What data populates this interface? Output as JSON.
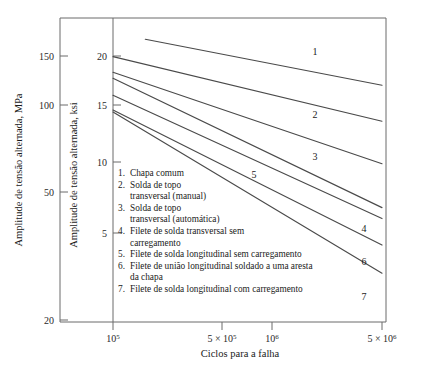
{
  "chart_data": {
    "type": "line",
    "title": "",
    "xlabel": "Ciclos para a falha",
    "ylabel_left": "Amplitude de tensão alternada, MPa",
    "ylabel_right": "Amplitude de tensão alternada, ksi",
    "xscale": "log",
    "yscale": "log",
    "xlim": [
      100000,
      5000000
    ],
    "ylim_mpa": [
      20,
      170
    ],
    "ylim_ksi": [
      2.9,
      24.7
    ],
    "xticks": [
      100000,
      500000,
      1000000,
      5000000
    ],
    "xticklabels": [
      "10⁵",
      "5 × 10⁵",
      "10⁶",
      "5 × 10⁶"
    ],
    "yticks_mpa": [
      150,
      100,
      50,
      20
    ],
    "yticklabels_mpa": [
      "150",
      "100",
      "50",
      "20"
    ],
    "yticks_ksi": [
      20,
      15,
      10,
      5
    ],
    "yticklabels_ksi": [
      "20",
      "15",
      "10",
      "5"
    ],
    "grid": false,
    "legend_position": "inside-lower-left",
    "series": [
      {
        "name": "1",
        "label": "Chapa comum",
        "x": [
          160000,
          5000000
        ],
        "y_ksi": [
          22.8,
          15.9
        ]
      },
      {
        "name": "2",
        "label": "Solda de topo transversal (manual)",
        "x": [
          100000,
          5000000
        ],
        "y_ksi": [
          19.9,
          12.0
        ]
      },
      {
        "name": "3",
        "label": "Solda de topo transversal (automática)",
        "x": [
          100000,
          5000000
        ],
        "y_ksi": [
          17.6,
          8.6
        ]
      },
      {
        "name": "4",
        "label": "Filete de solda transversal sem carregamento",
        "x": [
          100000,
          5000000
        ],
        "y_ksi": [
          16.8,
          6.1
        ]
      },
      {
        "name": "5",
        "label": "Filete de solda longitudinal sem carregamento",
        "x": [
          100000,
          5000000
        ],
        "y_ksi": [
          14.7,
          5.6
        ]
      },
      {
        "name": "6",
        "label": "Filete de união longitudinal soldado a uma aresta da chapa",
        "x": [
          100000,
          5000000
        ],
        "y_ksi": [
          13.1,
          4.55
        ]
      },
      {
        "name": "7",
        "label": "Filete de solda longitudinal com carregamento",
        "x": [
          100000,
          5000000
        ],
        "y_ksi": [
          12.9,
          3.65
        ]
      }
    ]
  },
  "axes": {
    "x_label": "Ciclos para a falha",
    "y_left_label": "Amplitude de tensão alternada, MPa",
    "y_right_label": "Amplitude de tensão alternada, ksi",
    "x_tick_labels": [
      "10⁵",
      "5 × 10⁵",
      "10⁶",
      "5 × 10⁶"
    ],
    "y_left_tick_labels": [
      "150",
      "100",
      "50",
      "20"
    ],
    "y_right_tick_labels": [
      "20",
      "15",
      "10",
      "5"
    ]
  },
  "curve_numbers": [
    "1",
    "2",
    "3",
    "4",
    "5",
    "6",
    "7"
  ],
  "legend": {
    "items": [
      {
        "num": "1.",
        "text": "Chapa comum"
      },
      {
        "num": "2.",
        "text": "Solda de topo"
      },
      {
        "num": "",
        "text": "transversal (manual)"
      },
      {
        "num": "3.",
        "text": "Solda de topo"
      },
      {
        "num": "",
        "text": "transversal (automática)"
      },
      {
        "num": "4.",
        "text": "Filete de solda transversal sem"
      },
      {
        "num": "",
        "text": "carregamento"
      },
      {
        "num": "5.",
        "text": "Filete de solda longitudinal sem carregamento"
      },
      {
        "num": "6.",
        "text": "Filete de união longitudinal soldado a uma aresta"
      },
      {
        "num": "",
        "text": "da chapa"
      },
      {
        "num": "7.",
        "text": "Filete de solda longitudinal com carregamento"
      }
    ]
  },
  "colors": {
    "background": "#ffffff",
    "axis": "#6b6b6b",
    "curve": "#4a4a4a",
    "text": "#1a1a1a"
  }
}
